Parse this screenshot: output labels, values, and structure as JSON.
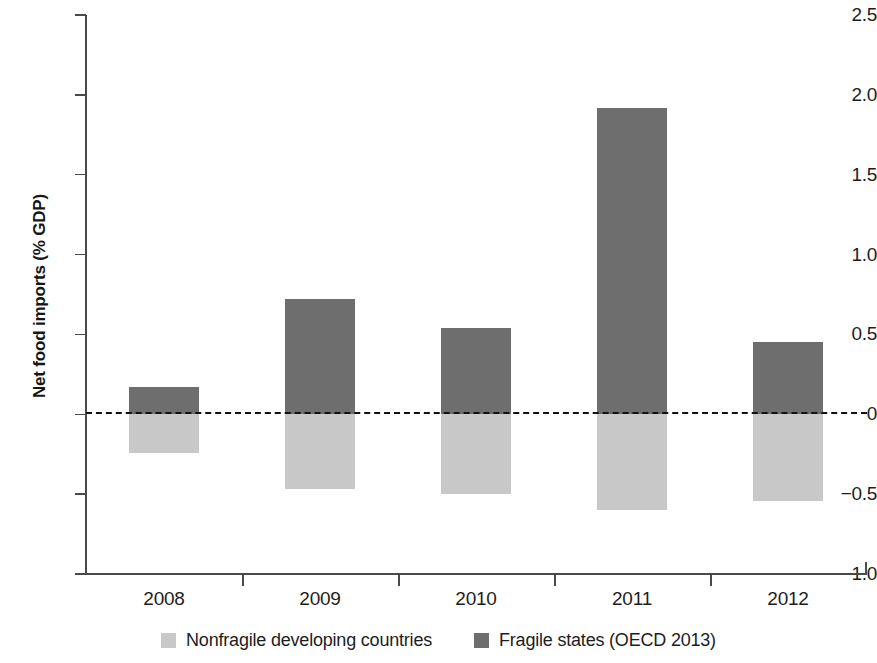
{
  "chart_data": {
    "type": "bar",
    "title": "",
    "subtitle": "",
    "xlabel": "",
    "ylabel": "Net food imports (% GDP)",
    "categories": [
      "2008",
      "2009",
      "2010",
      "2011",
      "2012"
    ],
    "series": [
      {
        "name": "Nonfragile developing countries",
        "color": "#c8c8c8",
        "values": [
          -0.245,
          -0.47,
          -0.5,
          -0.6,
          -0.545
        ]
      },
      {
        "name": "Fragile states (OECD 2013)",
        "color": "#6e6e6e",
        "values": [
          0.17,
          0.72,
          0.54,
          1.92,
          0.45
        ]
      }
    ],
    "ylim": [
      -1.0,
      2.5
    ],
    "yticks": [
      2.5,
      2.0,
      1.5,
      1.0,
      0.5,
      0,
      -0.5,
      -1.0
    ],
    "ytick_labels": [
      "2.5",
      "2.0",
      "1.5",
      "1.0",
      "0.5",
      "0",
      "−0.5",
      "−1.0"
    ],
    "grid": false,
    "zero_line": true,
    "zero_line_style": "dashed",
    "legend_position": "bottom",
    "bar_layout": "stacked-around-zero"
  },
  "axis": {
    "y_title": "Net food imports (% GDP)"
  },
  "legend": {
    "items": [
      {
        "label": "Nonfragile developing countries",
        "color": "#c8c8c8"
      },
      {
        "label": "Fragile states (OECD 2013)",
        "color": "#6e6e6e"
      }
    ]
  }
}
